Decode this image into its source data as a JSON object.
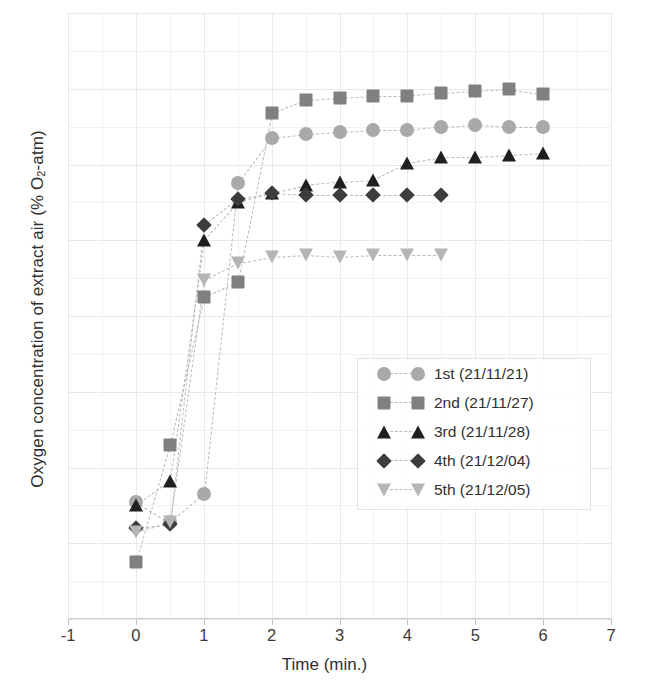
{
  "chart_data": {
    "type": "scatter",
    "title": "",
    "xlabel": "Time (min.)",
    "ylabel": "Oxygen concentration of extract air (% O2-atm)",
    "ylabel_html": "Oxygen concentration of extract air (% O<sub>2</sub>-atm)",
    "xlim": [
      -1,
      7
    ],
    "ylim": [
      18,
      34
    ],
    "xticks": [
      -1,
      0,
      1,
      2,
      3,
      4,
      5,
      6,
      7
    ],
    "yticks": [
      18,
      20,
      22,
      24,
      26,
      28,
      30,
      32,
      34
    ],
    "grid": true,
    "legend_position": "center-right",
    "linestyle": "dashed",
    "series": [
      {
        "name": "1st (21/11/21)",
        "marker": "circle",
        "color": "#a9a9a9",
        "x": [
          0,
          0.5,
          1,
          1.5,
          2,
          2.5,
          3,
          3.5,
          4,
          4.5,
          5,
          5.5,
          6
        ],
        "y": [
          21.1,
          20.55,
          21.3,
          29.5,
          30.7,
          30.8,
          30.85,
          30.9,
          30.9,
          31.0,
          31.05,
          31.0,
          31.0
        ]
      },
      {
        "name": "2nd (21/11/27)",
        "marker": "square",
        "color": "#808080",
        "x": [
          0,
          0.5,
          1,
          1.5,
          2,
          2.5,
          3,
          3.5,
          4,
          4.5,
          5,
          5.5,
          6
        ],
        "y": [
          19.5,
          22.6,
          26.5,
          26.9,
          31.35,
          31.7,
          31.75,
          31.8,
          31.8,
          31.9,
          31.95,
          32.0,
          31.85
        ]
      },
      {
        "name": "3rd (21/11/28)",
        "marker": "triangle-up",
        "color": "#1f1f1f",
        "x": [
          0,
          0.5,
          1,
          1.5,
          2,
          2.5,
          3,
          3.5,
          4,
          4.5,
          5,
          5.5,
          6
        ],
        "y": [
          21.0,
          21.65,
          28.0,
          29.0,
          29.25,
          29.45,
          29.55,
          29.6,
          30.05,
          30.2,
          30.2,
          30.25,
          30.3
        ]
      },
      {
        "name": "4th (21/12/04)",
        "marker": "diamond",
        "color": "#3d3d3d",
        "x": [
          0,
          0.5,
          1,
          1.5,
          2,
          2.5,
          3,
          3.5,
          4,
          4.5
        ],
        "y": [
          20.4,
          20.5,
          28.4,
          29.1,
          29.25,
          29.2,
          29.2,
          29.2,
          29.2,
          29.2
        ]
      },
      {
        "name": "5th (21/12/05)",
        "marker": "triangle-down",
        "color": "#b5b5b5",
        "x": [
          0,
          0.5,
          1,
          1.5,
          2,
          2.5,
          3,
          3.5,
          4,
          4.5
        ],
        "y": [
          20.3,
          20.55,
          26.95,
          27.4,
          27.55,
          27.6,
          27.55,
          27.6,
          27.6,
          27.6
        ]
      }
    ]
  },
  "axis": {
    "ytick_labels": [
      "34",
      "32",
      "30",
      "28",
      "26",
      "24",
      "22",
      "20",
      "18"
    ],
    "xtick_labels": [
      "-1",
      "0",
      "1",
      "2",
      "3",
      "4",
      "5",
      "6",
      "7"
    ]
  },
  "legend": {
    "entries": [
      {
        "label": "1st (21/11/21)",
        "marker": "circle",
        "color": "#a9a9a9"
      },
      {
        "label": "2nd (21/11/27)",
        "marker": "square",
        "color": "#808080"
      },
      {
        "label": "3rd (21/11/28)",
        "marker": "triangle-up",
        "color": "#1f1f1f"
      },
      {
        "label": "4th (21/12/04)",
        "marker": "diamond",
        "color": "#3d3d3d"
      },
      {
        "label": "5th (21/12/05)",
        "marker": "triangle-down",
        "color": "#b5b5b5"
      }
    ]
  }
}
